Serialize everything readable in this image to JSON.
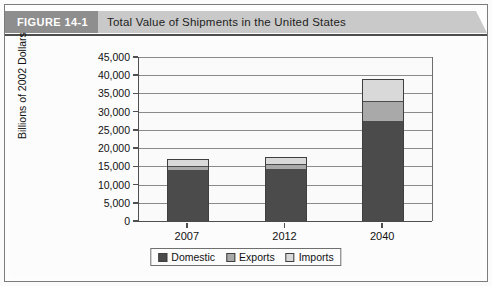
{
  "header": {
    "figure_tag": "FIGURE 14-1",
    "title": "Total Value of Shipments in the United States"
  },
  "colors": {
    "domestic": "#4b4b4b",
    "exports": "#a9a9a9",
    "imports": "#d9d9d9",
    "figure_tag_bg": "#8e8e8e",
    "header_bg": "#c9c9c9",
    "axis": "#4f4f4f",
    "gridline": "#8a8a8a"
  },
  "chart_data": {
    "type": "bar",
    "stacked": true,
    "title": "Total Value of Shipments in the United States",
    "xlabel": "",
    "ylabel": "Billions of 2002 Dollars",
    "categories": [
      "2007",
      "2012",
      "2040"
    ],
    "series": [
      {
        "name": "Domestic",
        "values": [
          14000,
          14200,
          27500
        ]
      },
      {
        "name": "Exports",
        "values": [
          1200,
          1400,
          5300
        ]
      },
      {
        "name": "Imports",
        "values": [
          1800,
          1900,
          6200
        ]
      }
    ],
    "totals": [
      17000,
      17500,
      39000
    ],
    "ylim": [
      0,
      45000
    ],
    "ytick_step": 5000,
    "yticks": [
      "0",
      "5,000",
      "10,000",
      "15,000",
      "20,000",
      "25,000",
      "30,000",
      "35,000",
      "40,000",
      "45,000"
    ],
    "grid": true,
    "legend_position": "bottom",
    "legend": [
      "Domestic",
      "Exports",
      "Imports"
    ]
  }
}
